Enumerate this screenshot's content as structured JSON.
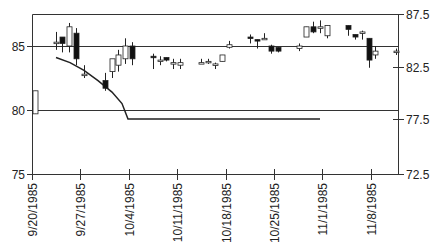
{
  "chart_data": {
    "type": "candlestick",
    "title": "",
    "xlabel": "",
    "ylabel_left": "",
    "ylabel_right": "",
    "x_ticks": [
      "9/20/1985",
      "9/27/1985",
      "10/4/1985",
      "10/11/1985",
      "10/18/1985",
      "10/25/1985",
      "11/1/1985",
      "11/8/1985"
    ],
    "y_left": {
      "ticks": [
        75,
        80,
        85
      ],
      "ylim": [
        75,
        87.5
      ]
    },
    "y_right": {
      "ticks": [
        72.5,
        77.5,
        82.5,
        87.5
      ],
      "ylim": [
        72.5,
        87.5
      ]
    },
    "reference_lines": [
      85,
      80
    ],
    "candles": [
      {
        "x": 35,
        "open": 79.7,
        "close": 81.5,
        "high": 81.5,
        "low": 79.7,
        "up": true
      },
      {
        "x": 56,
        "open": 85.3,
        "close": 85.3,
        "high": 86.1,
        "low": 84.7,
        "up": true
      },
      {
        "x": 62,
        "open": 85.7,
        "close": 85.2,
        "high": 85.7,
        "low": 84.5,
        "up": false
      },
      {
        "x": 69,
        "open": 85.0,
        "close": 86.5,
        "high": 86.8,
        "low": 84.5,
        "up": true
      },
      {
        "x": 76,
        "open": 86.0,
        "close": 84.0,
        "high": 86.4,
        "low": 83.5,
        "up": false
      },
      {
        "x": 84,
        "open": 82.8,
        "close": 82.7,
        "high": 83.5,
        "low": 82.5,
        "up": true
      },
      {
        "x": 105,
        "open": 82.3,
        "close": 81.7,
        "high": 82.9,
        "low": 81.5,
        "up": false
      },
      {
        "x": 112,
        "open": 83.0,
        "close": 84.0,
        "high": 83.8,
        "low": 82.5,
        "up": true
      },
      {
        "x": 118,
        "open": 83.5,
        "close": 84.3,
        "high": 84.7,
        "low": 83.0,
        "up": true
      },
      {
        "x": 125,
        "open": 84.0,
        "close": 85.0,
        "high": 85.6,
        "low": 83.6,
        "up": true
      },
      {
        "x": 132,
        "open": 85.0,
        "close": 84.0,
        "high": 85.3,
        "low": 83.5,
        "up": false
      },
      {
        "x": 153,
        "open": 84.2,
        "close": 84.2,
        "high": 84.4,
        "low": 83.2,
        "up": false
      },
      {
        "x": 160,
        "open": 83.8,
        "close": 83.9,
        "high": 84.2,
        "low": 83.5,
        "up": true
      },
      {
        "x": 166,
        "open": 84.1,
        "close": 83.9,
        "high": 84.1,
        "low": 83.8,
        "up": false
      },
      {
        "x": 173,
        "open": 83.7,
        "close": 83.7,
        "high": 84.0,
        "low": 83.2,
        "up": true
      },
      {
        "x": 180,
        "open": 83.5,
        "close": 83.7,
        "high": 84.0,
        "low": 83.2,
        "up": true
      },
      {
        "x": 201,
        "open": 83.7,
        "close": 83.7,
        "high": 84.0,
        "low": 83.6,
        "up": true
      },
      {
        "x": 208,
        "open": 83.7,
        "close": 83.8,
        "high": 84.0,
        "low": 83.6,
        "up": true
      },
      {
        "x": 215,
        "open": 83.6,
        "close": 83.6,
        "high": 83.7,
        "low": 83.2,
        "up": true
      },
      {
        "x": 222,
        "open": 83.8,
        "close": 84.3,
        "high": 84.3,
        "low": 83.8,
        "up": true
      },
      {
        "x": 229,
        "open": 84.9,
        "close": 85.1,
        "high": 85.4,
        "low": 84.8,
        "up": true
      },
      {
        "x": 250,
        "open": 85.7,
        "close": 85.6,
        "high": 85.9,
        "low": 85.2,
        "up": false
      },
      {
        "x": 257,
        "open": 85.5,
        "close": 85.5,
        "high": 85.5,
        "low": 84.8,
        "up": false
      },
      {
        "x": 264,
        "open": 85.6,
        "close": 85.5,
        "high": 86.0,
        "low": 85.5,
        "up": true
      },
      {
        "x": 271,
        "open": 85.0,
        "close": 84.6,
        "high": 85.1,
        "low": 84.4,
        "up": false
      },
      {
        "x": 278,
        "open": 84.9,
        "close": 84.6,
        "high": 84.9,
        "low": 84.5,
        "up": false
      },
      {
        "x": 299,
        "open": 84.8,
        "close": 85.0,
        "high": 85.2,
        "low": 84.6,
        "up": true
      },
      {
        "x": 306,
        "open": 85.7,
        "close": 86.5,
        "high": 86.5,
        "low": 85.7,
        "up": true
      },
      {
        "x": 313,
        "open": 86.5,
        "close": 86.1,
        "high": 86.9,
        "low": 86.0,
        "up": false
      },
      {
        "x": 320,
        "open": 86.5,
        "close": 86.5,
        "high": 87.0,
        "low": 86.0,
        "up": true
      },
      {
        "x": 327,
        "open": 85.8,
        "close": 86.6,
        "high": 86.6,
        "low": 85.6,
        "up": true
      },
      {
        "x": 348,
        "open": 86.6,
        "close": 86.3,
        "high": 86.6,
        "low": 85.8,
        "up": false
      },
      {
        "x": 355,
        "open": 85.9,
        "close": 85.7,
        "high": 85.9,
        "low": 85.5,
        "up": false
      },
      {
        "x": 362,
        "open": 86.1,
        "close": 86.0,
        "high": 86.2,
        "low": 85.5,
        "up": true
      },
      {
        "x": 369,
        "open": 85.6,
        "close": 83.9,
        "high": 85.6,
        "low": 83.3,
        "up": false
      },
      {
        "x": 375,
        "open": 84.3,
        "close": 84.6,
        "high": 85.0,
        "low": 84.0,
        "up": true
      },
      {
        "x": 396,
        "open": 84.5,
        "close": 84.6,
        "high": 84.8,
        "low": 84.3,
        "up": true
      }
    ],
    "line_series": {
      "name": "trend",
      "points": [
        [
          56,
          84.1
        ],
        [
          70,
          83.7
        ],
        [
          84,
          83.1
        ],
        [
          98,
          82.3
        ],
        [
          112,
          81.4
        ],
        [
          122,
          80.5
        ],
        [
          128,
          79.3
        ],
        [
          137,
          79.3
        ],
        [
          320,
          79.3
        ]
      ]
    }
  }
}
